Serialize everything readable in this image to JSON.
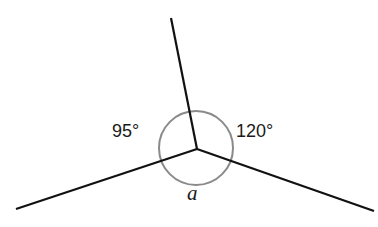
{
  "diagram": {
    "center": {
      "x": 197,
      "y": 149
    },
    "circle": {
      "radius": 37,
      "color": "#8a8a8a"
    },
    "rays": [
      {
        "name": "ray-up",
        "x2": 171,
        "y2": 18
      },
      {
        "name": "ray-left",
        "x2": 16,
        "y2": 209
      },
      {
        "name": "ray-right",
        "x2": 374,
        "y2": 211
      }
    ],
    "labels": {
      "left_angle": "95°",
      "right_angle": "120°",
      "bottom_angle": "a"
    },
    "angles": {
      "left_degrees": 95,
      "right_degrees": 120,
      "bottom_unknown": "a"
    }
  }
}
